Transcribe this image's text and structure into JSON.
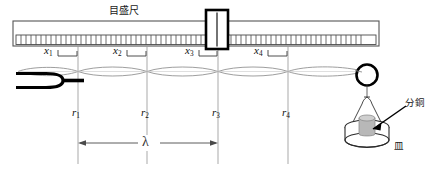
{
  "figure": {
    "title_label": "目盛尺",
    "wave_label": "λ",
    "weight_label": "分銅",
    "pan_label": "皿",
    "scale_positions": [
      {
        "id": "x1",
        "name": "x",
        "sub": "1"
      },
      {
        "id": "x2",
        "name": "x",
        "sub": "2"
      },
      {
        "id": "x3",
        "name": "x",
        "sub": "3"
      },
      {
        "id": "x4",
        "name": "x",
        "sub": "4"
      }
    ],
    "node_positions": [
      {
        "id": "r1",
        "name": "r",
        "sub": "1"
      },
      {
        "id": "r2",
        "name": "r",
        "sub": "2"
      },
      {
        "id": "r3",
        "name": "r",
        "sub": "3"
      },
      {
        "id": "r4",
        "name": "r",
        "sub": "4"
      }
    ],
    "parts": {
      "tuning_fork": "tuning-fork",
      "pulley": "pulley",
      "ruler": "measuring-ruler",
      "cursor": "ruler-cursor",
      "string": "vibrating-string",
      "pan": "weight-pan",
      "weight": "brass-weight"
    },
    "colors": {
      "ink": "#111111",
      "rule": "#555555",
      "light": "#999999",
      "weight_fill": "#b8b8b8"
    }
  }
}
